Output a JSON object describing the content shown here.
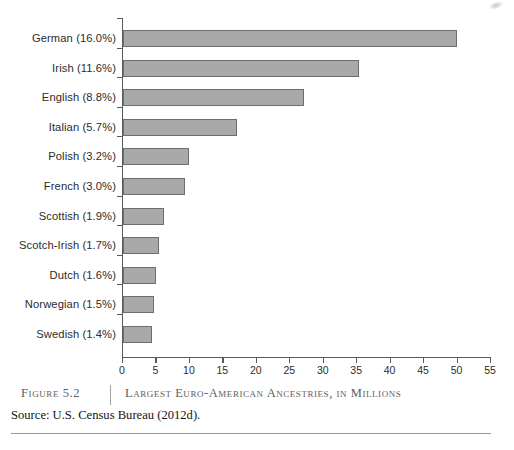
{
  "figure": {
    "number_label": "Figure 5.2",
    "title": "Largest Euro-American Ancestries, in Millions",
    "source": "Source: U.S. Census Bureau (2012d)."
  },
  "chart_data": {
    "type": "bar",
    "orientation": "horizontal",
    "title": "Largest Euro-American Ancestries, in Millions",
    "xlabel": "",
    "ylabel": "",
    "xlim": [
      0,
      55
    ],
    "xticks": [
      0,
      5,
      10,
      15,
      20,
      25,
      30,
      35,
      40,
      45,
      50,
      55
    ],
    "xtick_labels": [
      "0",
      "5",
      "10",
      "15",
      "20",
      "25",
      "30",
      "35",
      "40",
      "45",
      "50",
      "55"
    ],
    "grid": false,
    "legend": false,
    "bar_color": "#a9a9a9",
    "bar_edge_color": "#6d6d6d",
    "axis_color": "#5a5a5a",
    "categories": [
      "German (16.0%)",
      "Irish (11.6%)",
      "English (8.8%)",
      "Italian (5.7%)",
      "Polish (3.2%)",
      "French (3.0%)",
      "Scottish (1.9%)",
      "Scotch-Irish (1.7%)",
      "Dutch (1.6%)",
      "Norwegian (1.5%)",
      "Swedish (1.4%)"
    ],
    "values": [
      49.9,
      35.3,
      27.1,
      17.0,
      9.8,
      9.2,
      6.1,
      5.4,
      4.9,
      4.6,
      4.3
    ],
    "percentages": [
      16.0,
      11.6,
      8.8,
      5.7,
      3.2,
      3.0,
      1.9,
      1.7,
      1.6,
      1.5,
      1.4
    ],
    "units": "millions"
  }
}
